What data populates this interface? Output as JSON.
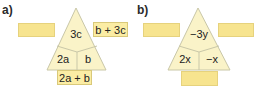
{
  "colors": {
    "triangle_fill": "#faf3c8",
    "triangle_stroke": "#c9c7a8",
    "box_fill": "#fbeda4",
    "empty_box_fill": "#f7e48f"
  },
  "panels": [
    {
      "label": "a)",
      "top_cell": "3c",
      "bottom_left_cell": "2a",
      "bottom_right_cell": "b",
      "left_box": "",
      "right_box": "b + 3c",
      "bottom_box": "2a + b"
    },
    {
      "label": "b)",
      "top_cell": "−3y",
      "bottom_left_cell": "2x",
      "bottom_right_cell": "−x",
      "left_box": "",
      "right_box": "",
      "bottom_box": ""
    }
  ]
}
